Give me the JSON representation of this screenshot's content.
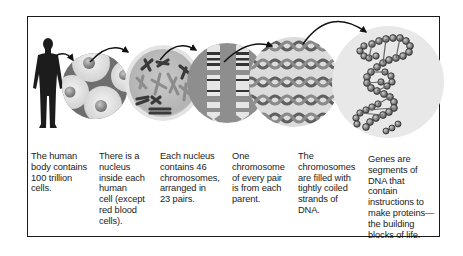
{
  "diagram": {
    "type": "biology-scale-progression",
    "colors": {
      "frame": "#1a1a1a",
      "silhouette": "#1c1c1c",
      "circle_light": "#e2e2e2",
      "circle_mid": "#9a9a9a",
      "circle_dark": "#5a5a5a",
      "arrow": "#111111"
    },
    "stages": [
      {
        "id": "body",
        "icon": "human-silhouette-icon",
        "caption": "The human body contains 100 trillion cells.",
        "lines": [
          "The human",
          "body contains",
          "100 trillion",
          "cells."
        ]
      },
      {
        "id": "cells",
        "icon": "cells-circle-icon",
        "caption": "There is a nucleus inside each human cell (except red blood cells).",
        "lines": [
          "There is a",
          "nucleus",
          "inside each",
          "human",
          "cell (except",
          "red blood",
          "cells)."
        ]
      },
      {
        "id": "nucleus",
        "icon": "nucleus-chromosomes-icon",
        "caption": "Each nucleus contains 46 chromosomes, arranged in 23 pairs.",
        "lines": [
          "Each nucleus",
          "contains 46",
          "chromosomes,",
          "arranged in",
          "23 pairs."
        ]
      },
      {
        "id": "chromosome-pair",
        "icon": "chromosome-pair-icon",
        "caption": "One chromosome of every pair is from each parent.",
        "lines": [
          "One",
          "chromosome",
          "of every pair",
          "is from each",
          "parent."
        ]
      },
      {
        "id": "dna-strands",
        "icon": "coiled-dna-strands-icon",
        "caption": "The chromosomes are filled with tightly coiled strands of DNA.",
        "lines": [
          "The",
          "chromosomes",
          "are filled with",
          "tightly coiled",
          "strands of",
          "DNA."
        ]
      },
      {
        "id": "genes",
        "icon": "dna-double-helix-icon",
        "caption": "Genes are segments of DNA that contain instructions to make proteins—the building blocks of life.",
        "lines": [
          "Genes are",
          "segments of",
          "DNA that",
          "contain",
          "instructions to",
          "make proteins—",
          "the building",
          "blocks of life."
        ]
      }
    ]
  }
}
